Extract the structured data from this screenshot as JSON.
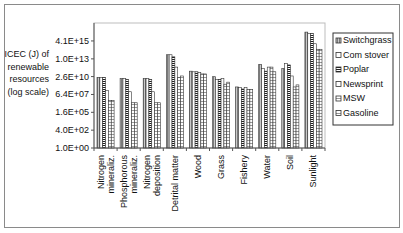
{
  "chart_data": {
    "type": "bar",
    "title": "",
    "xlabel": "",
    "ylabel": "ICEC (J) of renewable resources (log scale)",
    "ylabel_lines": [
      "ICEC (J) of",
      "renewable",
      "resources",
      "(log scale)"
    ],
    "yscale": "log",
    "ylim": [
      1.0,
      1.7e+18
    ],
    "y_ticks": [
      1.0,
      400.0,
      160000.0,
      64000000.0,
      26000000000.0,
      10000000000000.0,
      4100000000000000.0
    ],
    "y_tick_labels": [
      "1.0E+00",
      "4.0E+02",
      "1.6E+05",
      "6.4E+07",
      "2.6E+10",
      "1.0E+13",
      "4.1E+15"
    ],
    "grid": false,
    "legend_position": "right",
    "categories": [
      "Nitrogen mineraliz.",
      "Phosphorous mineraliz.",
      "Nitrogen deposition",
      "Detrital matter",
      "Wood",
      "Grass",
      "Fishery",
      "Water",
      "Soil",
      "Sunlight"
    ],
    "category_label_lines": [
      [
        "Nitrogen",
        "mineraliz."
      ],
      [
        "Phosphorous",
        "mineraliz."
      ],
      [
        "Nitrogen",
        "deposition"
      ],
      [
        "Detrital matter"
      ],
      [
        "Wood"
      ],
      [
        "Grass"
      ],
      [
        "Fishery"
      ],
      [
        "Water"
      ],
      [
        "Soil"
      ],
      [
        "Sunlight"
      ]
    ],
    "series": [
      {
        "name": "Switchgrass",
        "values": [
          20000000000.0,
          13000000000.0,
          13000000000.0,
          40000000000000.0,
          160000000000.0,
          25000000000.0,
          800000000.0,
          1600000000000.0,
          400000000000.0,
          8e+16
        ]
      },
      {
        "name": "Com stover",
        "values": [
          20000000000.0,
          13000000000.0,
          13000000000.0,
          40000000000000.0,
          130000000000.0,
          10000000000.0,
          630000000.0,
          400000000000.0,
          2000000000000.0,
          5e+16
        ]
      },
      {
        "name": "Poplar",
        "values": [
          20000000000.0,
          10000000000.0,
          10000000000.0,
          20000000000000.0,
          130000000000.0,
          10000000000.0,
          400000000.0,
          160000000000.0,
          1300000000000.0,
          5e+16
        ]
      },
      {
        "name": "Newsprint",
        "values": [
          250000000.0,
          160000000.0,
          160000000.0,
          630000000000.0,
          100000000000.0,
          13000000000.0,
          630000000.0,
          630000000000.0,
          32000000000.0,
          1600000000000000.0
        ]
      },
      {
        "name": "MSW",
        "values": [
          8000000.0,
          4000000.0,
          4000000.0,
          20000000000.0,
          63000000000.0,
          2000000000.0,
          320000000.0,
          630000000000.0,
          800000000.0,
          250000000000000.0
        ]
      },
      {
        "name": "Gasoline",
        "values": [
          8000000.0,
          4000000.0,
          4000000.0,
          32000000000.0,
          63000000000.0,
          4000000000.0,
          320000000.0,
          130000000000.0,
          1600000000.0,
          250000000000000.0
        ]
      }
    ]
  },
  "style": {
    "series_fills": [
      "#b0b0b0",
      "#ffffff",
      "#555555",
      "#ffffff",
      "#d8d8d8",
      "#ffffff"
    ],
    "series_patterns": [
      "vlines",
      "none",
      "hlines",
      "none",
      "hlines-light",
      "hlines-light"
    ],
    "axis_color": "#555555",
    "plot_border_color": "#bdbdbd"
  }
}
